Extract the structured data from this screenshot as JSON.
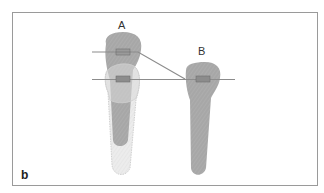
{
  "figure": {
    "panel_label": "b",
    "teeth": [
      {
        "id": "A",
        "label": "A",
        "state": "tipped",
        "ghost_outline": true
      },
      {
        "id": "B",
        "label": "B",
        "state": "upright"
      }
    ],
    "wires": [
      {
        "name": "upper-archwire",
        "description": "step wire from tooth A bracket to tooth B"
      },
      {
        "name": "lower-archwire",
        "description": "straight wire through level brackets"
      }
    ],
    "colors": {
      "frame": "#9a9a9a",
      "tooth": "#a9a9a9",
      "ghost_tooth": "#e4e4e4",
      "ghost_outline": "#cfcfcf",
      "wire": "#8c8c8c",
      "bracket": "#8a8a8a",
      "background": "#ffffff"
    }
  }
}
